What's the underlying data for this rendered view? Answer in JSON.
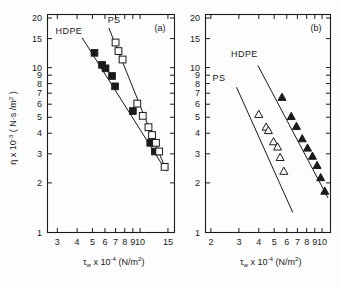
{
  "figure": {
    "background": "#fdfdfd",
    "ink": "#1a1a1a",
    "axis_label_x_main": "x 10",
    "axis_label_x_exp": "-4",
    "axis_label_x_tau": "τ",
    "axis_label_x_tausub": "w",
    "axis_label_x_units": "(N/m",
    "axis_label_x_unitsexp": "2",
    "axis_label_x_close": ")",
    "axis_label_y_eta": "η",
    "axis_label_y_main": "x 10",
    "axis_label_y_exp": "-3",
    "axis_label_y_units": "( N·s /m",
    "axis_label_y_unitsexp": "2",
    "axis_label_y_close": " )"
  },
  "chart_data": [
    {
      "type": "scatter",
      "panel_label": "(a)",
      "title": "",
      "xlabel": "τ_w x 10^-4 (N/m^2)",
      "ylabel": "η x 10^-3 (N·s/m^2)",
      "xscale": "log",
      "yscale": "log",
      "xlim": [
        2.6,
        16.5
      ],
      "ylim": [
        1.0,
        21.0
      ],
      "xticks": [
        3,
        4,
        5,
        6,
        7,
        8,
        9,
        10,
        15
      ],
      "xticklabels": [
        "3",
        "4",
        "5",
        "6",
        "7",
        "8",
        "9",
        "10",
        "15"
      ],
      "yticks": [
        2,
        3,
        4,
        5,
        6,
        7,
        8,
        9,
        10,
        15,
        20
      ],
      "yticklabels": [
        "2",
        "3",
        "4",
        "5",
        "6",
        "7",
        "8",
        "9",
        "10",
        "15",
        "20"
      ],
      "grid": false,
      "legend": "inline-annotations",
      "series": [
        {
          "name": "HDPE",
          "marker": "filled-square",
          "label_text": "HDPE",
          "label_x": 3.55,
          "label_y": 16.1,
          "points": [
            {
              "x": 5.15,
              "y": 12.3
            },
            {
              "x": 5.75,
              "y": 10.4
            },
            {
              "x": 6.05,
              "y": 9.9
            },
            {
              "x": 6.65,
              "y": 8.9
            },
            {
              "x": 6.95,
              "y": 7.7
            },
            {
              "x": 9.0,
              "y": 5.45
            },
            {
              "x": 11.6,
              "y": 3.5
            },
            {
              "x": 12.4,
              "y": 3.1
            }
          ],
          "fit_line": [
            {
              "x": 4.3,
              "y": 15.2
            },
            {
              "x": 13.9,
              "y": 2.55
            }
          ]
        },
        {
          "name": "PS",
          "marker": "open-square",
          "label_text": "PS",
          "label_x": 6.85,
          "label_y": 18.6,
          "points": [
            {
              "x": 7.0,
              "y": 14.2
            },
            {
              "x": 7.3,
              "y": 12.6
            },
            {
              "x": 7.75,
              "y": 11.2
            },
            {
              "x": 9.6,
              "y": 6.05
            },
            {
              "x": 10.4,
              "y": 5.1
            },
            {
              "x": 11.3,
              "y": 4.35
            },
            {
              "x": 11.9,
              "y": 3.9
            },
            {
              "x": 12.6,
              "y": 3.5
            },
            {
              "x": 13.2,
              "y": 3.1
            },
            {
              "x": 14.3,
              "y": 2.5
            }
          ],
          "fit_line": [
            {
              "x": 6.35,
              "y": 17.4
            },
            {
              "x": 14.7,
              "y": 2.35
            }
          ]
        }
      ]
    },
    {
      "type": "scatter",
      "panel_label": "(b)",
      "title": "",
      "xlabel": "τ_w x 10^-4 (N/m^2)",
      "ylabel": "η x 10^-3 (N·s/m^2)",
      "xscale": "log",
      "yscale": "log",
      "xlim": [
        1.85,
        11.3
      ],
      "ylim": [
        1.0,
        21.0
      ],
      "xticks": [
        2,
        3,
        4,
        5,
        6,
        7,
        8,
        9,
        10
      ],
      "xticklabels": [
        "2",
        "3",
        "4",
        "5",
        "6",
        "7",
        "8",
        "9",
        "10"
      ],
      "yticks": [
        2,
        3,
        4,
        5,
        6,
        7,
        8,
        9,
        10,
        15,
        20
      ],
      "yticklabels": [
        "2",
        "3",
        "4",
        "5",
        "6",
        "7",
        "8",
        "9",
        "10",
        "15",
        "20"
      ],
      "grid": false,
      "legend": "inline-annotations",
      "series": [
        {
          "name": "HDPE",
          "marker": "filled-triangle",
          "label_text": "HDPE",
          "label_x": 3.25,
          "label_y": 11.6,
          "points": [
            {
              "x": 5.6,
              "y": 6.6
            },
            {
              "x": 6.4,
              "y": 5.05
            },
            {
              "x": 6.9,
              "y": 4.4
            },
            {
              "x": 7.5,
              "y": 3.7
            },
            {
              "x": 8.1,
              "y": 3.25
            },
            {
              "x": 8.7,
              "y": 2.9
            },
            {
              "x": 9.3,
              "y": 2.55
            },
            {
              "x": 9.8,
              "y": 2.15
            },
            {
              "x": 10.4,
              "y": 1.78
            }
          ],
          "fit_line": [
            {
              "x": 3.95,
              "y": 10.3
            },
            {
              "x": 10.9,
              "y": 1.62
            }
          ]
        },
        {
          "name": "PS",
          "marker": "open-triangle",
          "label_text": "PS",
          "label_x": 2.25,
          "label_y": 8.3,
          "points": [
            {
              "x": 4.0,
              "y": 5.2
            },
            {
              "x": 4.45,
              "y": 4.35
            },
            {
              "x": 4.6,
              "y": 4.15
            },
            {
              "x": 4.95,
              "y": 3.55
            },
            {
              "x": 5.25,
              "y": 3.3
            },
            {
              "x": 5.45,
              "y": 2.85
            },
            {
              "x": 5.75,
              "y": 2.35
            }
          ],
          "fit_line": [
            {
              "x": 2.9,
              "y": 7.6
            },
            {
              "x": 6.55,
              "y": 1.32
            }
          ]
        }
      ]
    }
  ]
}
